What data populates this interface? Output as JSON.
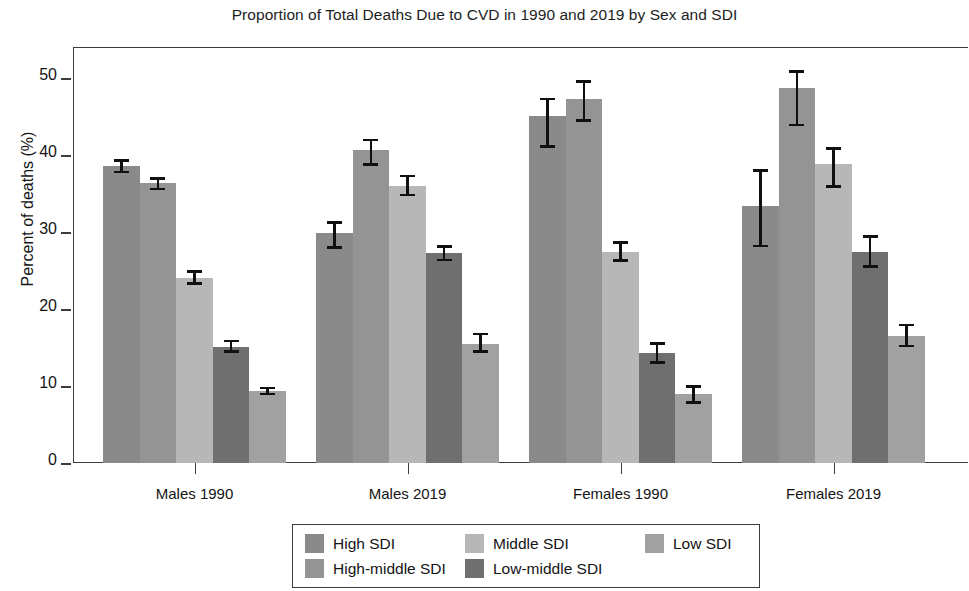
{
  "chart_data": {
    "type": "bar",
    "title": "Proportion of Total Deaths Due to CVD in 1990 and 2019 by Sex and SDI",
    "xlabel": "",
    "ylabel": "Percent of deaths (%)",
    "ylim": [
      0,
      54
    ],
    "yticks": [
      0,
      10,
      20,
      30,
      40,
      50
    ],
    "ytick_labels": [
      "0",
      "10",
      "20",
      "30",
      "40",
      "50"
    ],
    "grid": false,
    "legend_position": "bottom-center",
    "categories": [
      "Males 1990",
      "Males 2019",
      "Females 1990",
      "Females 2019"
    ],
    "series": [
      {
        "name": "High SDI",
        "color": "#8a8a8a",
        "values": [
          38.5,
          29.9,
          45.0,
          33.4
        ],
        "err_low": [
          37.6,
          27.8,
          40.9,
          28.0
        ],
        "err_high": [
          39.4,
          31.4,
          47.4,
          38.1
        ]
      },
      {
        "name": "High-middle SDI",
        "color": "#949494",
        "values": [
          36.3,
          40.6,
          47.3,
          48.7
        ],
        "err_low": [
          35.4,
          38.6,
          44.3,
          43.7
        ],
        "err_high": [
          37.1,
          42.1,
          49.7,
          51.0
        ]
      },
      {
        "name": "Middle SDI",
        "color": "#b7b7b7",
        "values": [
          24.0,
          36.0,
          27.4,
          38.8
        ],
        "err_low": [
          23.1,
          34.6,
          26.1,
          35.7
        ],
        "err_high": [
          25.0,
          37.4,
          28.8,
          41.0
        ]
      },
      {
        "name": "Low-middle SDI",
        "color": "#6f6f6f",
        "values": [
          15.1,
          27.3,
          14.3,
          27.4
        ],
        "err_low": [
          14.3,
          26.2,
          12.9,
          25.3
        ],
        "err_high": [
          16.0,
          28.3,
          15.7,
          29.6
        ]
      },
      {
        "name": "Low SDI",
        "color": "#a1a1a1",
        "values": [
          9.3,
          15.5,
          8.9,
          16.5
        ],
        "err_low": [
          8.8,
          14.3,
          7.7,
          15.0
        ],
        "err_high": [
          9.9,
          16.9,
          10.1,
          18.1
        ]
      }
    ]
  },
  "legend": {
    "entries": [
      {
        "label": "High SDI",
        "color": "#8a8a8a"
      },
      {
        "label": "Middle SDI",
        "color": "#b7b7b7"
      },
      {
        "label": "Low SDI",
        "color": "#a1a1a1"
      },
      {
        "label": "High-middle SDI",
        "color": "#949494"
      },
      {
        "label": "Low-middle SDI",
        "color": "#6f6f6f"
      }
    ],
    "order": [
      0,
      1,
      2,
      3,
      4
    ]
  }
}
